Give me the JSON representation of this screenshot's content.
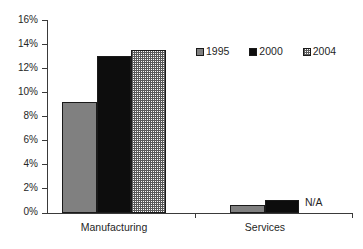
{
  "chart_data": {
    "type": "bar",
    "title": "",
    "subtitle": "",
    "xlabel": "",
    "ylabel": "",
    "categories": [
      "Manufacturing",
      "Services"
    ],
    "series": [
      {
        "name": "1995",
        "values": [
          9.2,
          0.7
        ],
        "color": "#808080",
        "pattern": "solid-gray"
      },
      {
        "name": "2000",
        "values": [
          13.0,
          1.1
        ],
        "color": "#0d0d0d",
        "pattern": "solid-black"
      },
      {
        "name": "2004",
        "values": [
          13.5,
          null
        ],
        "color": "#fbfbfb",
        "pattern": "checkered"
      }
    ],
    "ylim": [
      0,
      16
    ],
    "ytick_step": 2,
    "ytick_labels": [
      "16%",
      "14%",
      "12%",
      "10%",
      "8%",
      "6%",
      "4%",
      "2%",
      "0%"
    ],
    "ytick_values": [
      16,
      14,
      12,
      10,
      8,
      6,
      4,
      2,
      0
    ],
    "grid": false,
    "legend_position": "top-right",
    "annotations": [
      {
        "text": "N/A",
        "category": "Services",
        "series": "2004"
      }
    ]
  },
  "legend": {
    "items": [
      {
        "label": "1995",
        "swatch": "legend-swatch-1995"
      },
      {
        "label": "2000",
        "swatch": "legend-swatch-2000"
      },
      {
        "label": "2004",
        "swatch": "legend-swatch-2004"
      }
    ]
  },
  "axes": {
    "y_labels": [
      "16%",
      "14%",
      "12%",
      "10%",
      "8%",
      "6%",
      "4%",
      "2%",
      "0%"
    ],
    "x_labels": [
      "Manufacturing",
      "Services"
    ]
  },
  "notes": {
    "na_text": "N/A"
  }
}
